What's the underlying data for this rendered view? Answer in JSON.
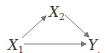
{
  "diagram": {
    "type": "directed-graph",
    "nodes": [
      {
        "id": "x1",
        "label": "X",
        "subscript": "1"
      },
      {
        "id": "x2",
        "label": "X",
        "subscript": "2"
      },
      {
        "id": "y",
        "label": "Y",
        "subscript": "."
      }
    ],
    "edges": [
      {
        "from": "x1",
        "to": "x2"
      },
      {
        "from": "x2",
        "to": "y"
      },
      {
        "from": "x1",
        "to": "y"
      }
    ],
    "colors": {
      "stroke": "#777777",
      "text": "#333333"
    }
  }
}
